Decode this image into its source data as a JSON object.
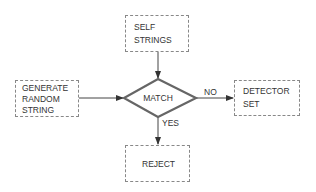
{
  "diagram": {
    "nodes": {
      "self_strings": {
        "lines": [
          "SELF",
          "STRINGS"
        ]
      },
      "generate": {
        "lines": [
          "GENERATE",
          "RANDOM",
          "STRING"
        ]
      },
      "match": {
        "label": "MATCH"
      },
      "detector": {
        "lines": [
          "DETECTOR",
          "SET"
        ]
      },
      "reject": {
        "label": "REJECT"
      }
    },
    "edges": {
      "no_label": "NO",
      "yes_label": "YES"
    },
    "colors": {
      "box_border": "#888888",
      "diamond_stroke": "#666666",
      "line": "#444444"
    }
  }
}
